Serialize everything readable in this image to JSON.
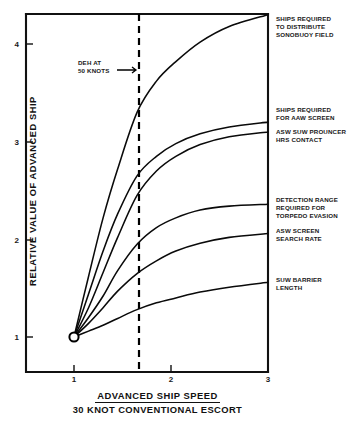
{
  "chart_data": {
    "type": "line",
    "title": "",
    "xlabel": "ADVANCED SHIP SPEED",
    "xlabel_denominator": "30 KNOT CONVENTIONAL ESCORT",
    "ylabel": "RELATIVE VALUE OF ADVANCED SHIP",
    "xlim": [
      0.85,
      3.0
    ],
    "ylim": [
      0.55,
      4.45
    ],
    "xticks": [
      1,
      2,
      3
    ],
    "xtick_labels": [
      "1",
      "2",
      "3"
    ],
    "yticks": [
      1,
      2,
      3,
      4
    ],
    "ytick_labels": [
      "1",
      "2",
      "3",
      "4"
    ],
    "grid": false,
    "legend": "right-inline-labels",
    "origin_point": {
      "x": 1,
      "y": 1,
      "marker": "open-circle"
    },
    "annotations": [
      {
        "name": "deh-marker",
        "text": "DEH AT\n50 KNOTS",
        "x": 1.65,
        "y": 3.55,
        "type": "vertical-dashed-line-with-arrow"
      }
    ],
    "reference_line": {
      "x": 1.65,
      "style": "dashed"
    },
    "x": [
      1,
      1.15,
      1.3,
      1.45,
      1.65,
      1.85,
      2.05,
      2.3,
      2.6,
      3.0
    ],
    "series": [
      {
        "name": "ships-required-to-distribute-sonobuoy-field",
        "label": "SHIPS REQUIRED\nTO DISTRIBUTE\nSONOBUOY FIELD",
        "values": [
          1.0,
          1.62,
          2.22,
          2.72,
          3.3,
          3.62,
          3.82,
          4.02,
          4.18,
          4.3
        ]
      },
      {
        "name": "ships-required-for-aaw-screen",
        "label": "SHIPS REQUIRED\nFOR AAW SCREEN",
        "values": [
          1.0,
          1.44,
          1.88,
          2.26,
          2.65,
          2.85,
          2.98,
          3.08,
          3.15,
          3.2
        ]
      },
      {
        "name": "asw-sub-pouncer-hrs-contact",
        "label": "ASW SUW PROUNCER\nHRS CONTACT",
        "values": [
          1.0,
          1.3,
          1.66,
          2.02,
          2.45,
          2.7,
          2.85,
          2.97,
          3.05,
          3.1
        ]
      },
      {
        "name": "detection-range-required-for-torpedo-evasion",
        "label": "DETECTION RANGE\nREQUIRED FOR\nTORPEDO EVASION",
        "values": [
          1.0,
          1.2,
          1.42,
          1.68,
          1.95,
          2.12,
          2.22,
          2.3,
          2.34,
          2.36
        ]
      },
      {
        "name": "asw-screen-search-rate",
        "label": "ASW SCREEN\nSEARCH RATE",
        "values": [
          1.0,
          1.14,
          1.3,
          1.47,
          1.65,
          1.78,
          1.88,
          1.96,
          2.02,
          2.06
        ]
      },
      {
        "name": "suw-barrier-length",
        "label": "SUW BARRIER\nLENGTH",
        "values": [
          1.0,
          1.06,
          1.12,
          1.19,
          1.28,
          1.35,
          1.4,
          1.46,
          1.51,
          1.56
        ]
      }
    ]
  }
}
